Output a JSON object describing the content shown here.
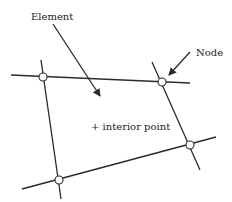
{
  "labels": {
    "element": "Element",
    "node": "Node",
    "interior_point": "+ interior point"
  },
  "colors": {
    "line": "#2a2a2a",
    "background": "#ffffff",
    "node_fill": "#ffffff"
  },
  "nodes": [
    {
      "name": "top-left",
      "x": 43,
      "y": 77
    },
    {
      "name": "top-right",
      "x": 162,
      "y": 82
    },
    {
      "name": "bottom-right",
      "x": 190,
      "y": 145
    },
    {
      "name": "bottom-left",
      "x": 59,
      "y": 180
    }
  ]
}
